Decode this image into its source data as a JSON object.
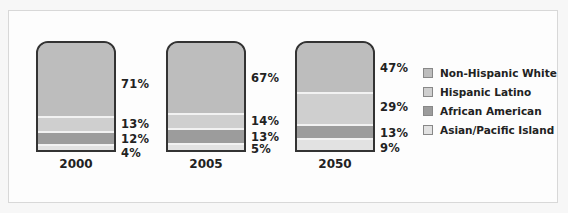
{
  "chart_data": {
    "type": "bar",
    "stacked": true,
    "title": "",
    "xlabel": "",
    "ylabel": "",
    "ylim": [
      0,
      100
    ],
    "categories": [
      "2000",
      "2005",
      "2050"
    ],
    "series": [
      {
        "name": "Non-Hispanic White",
        "color": "#bdbdbd",
        "values": [
          71,
          67,
          47
        ],
        "labels": [
          "71%",
          "67%",
          "47%"
        ]
      },
      {
        "name": "Hispanic Latino",
        "color": "#cfcfcf",
        "values": [
          13,
          14,
          29
        ],
        "labels": [
          "13%",
          "14%",
          "29%"
        ]
      },
      {
        "name": "African American",
        "color": "#9c9c9c",
        "values": [
          12,
          13,
          13
        ],
        "labels": [
          "12%",
          "13%",
          "13%"
        ]
      },
      {
        "name": "Asian/Pacific Island",
        "color": "#e2e2e2",
        "values": [
          4,
          5,
          9
        ],
        "labels": [
          "4%",
          "5%",
          "9%"
        ]
      }
    ],
    "legend_position": "right",
    "grid": false
  },
  "legend": [
    {
      "label": "Non-Hispanic White",
      "color": "#bdbdbd"
    },
    {
      "label": "Hispanic Latino",
      "color": "#cfcfcf"
    },
    {
      "label": "African American",
      "color": "#9c9c9c"
    },
    {
      "label": "Asian/Pacific Island",
      "color": "#e2e2e2"
    }
  ]
}
